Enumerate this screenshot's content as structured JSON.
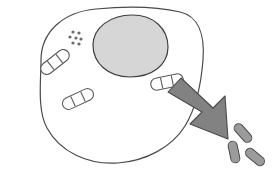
{
  "figure": {
    "background_color": "#ffffff",
    "width": 274,
    "height": 177
  },
  "colors": {
    "outline": "#4a4a4a",
    "cell_fill": "#ffffff",
    "nucleus_fill": "#d6d6d6",
    "nucleus_outline": "#3f3f3f",
    "organelle_fill": "#ffffff",
    "organelle_outline": "#5a5a5a",
    "granule_fill": "#6b6b6b",
    "arrow_fill": "#828282",
    "arrow_outline": "#4a4a4a",
    "bacteria_fill": "#9b9b9b",
    "bacteria_outline": "#4a4a4a"
  },
  "cell": {
    "label": "cell-body",
    "outline_width": 1.2,
    "path": "M 41 60 C 41 33, 62 12, 96 9 C 128 6, 158 7, 180 12 C 198 16, 205 34, 203 60 C 201 86, 196 108, 185 126 C 172 147, 146 161, 118 163 C 88 165, 60 152, 47 128 C 37 110, 41 80, 41 60 Z"
  },
  "nucleus": {
    "label": "nucleus",
    "cx": 130,
    "cy": 45,
    "rx": 37,
    "ry": 31,
    "path": "M 93 45 C 93 28, 110 15, 132 15 C 154 15, 168 29, 168 47 C 168 65, 152 77, 130 77 C 108 77, 93 63, 93 45 Z"
  },
  "granule_cluster": {
    "label": "granule-cluster",
    "count": 7,
    "radius": 1.6,
    "dots": [
      {
        "cx": 73,
        "cy": 32
      },
      {
        "cx": 79,
        "cy": 33
      },
      {
        "cx": 70,
        "cy": 37
      },
      {
        "cx": 76,
        "cy": 38
      },
      {
        "cx": 81,
        "cy": 39
      },
      {
        "cx": 73,
        "cy": 43
      },
      {
        "cx": 79,
        "cy": 44
      }
    ]
  },
  "organelles": [
    {
      "name": "internal-bacterium-upper-left",
      "cx": 55,
      "cy": 62,
      "length": 33,
      "thickness": 12,
      "rotation": -38,
      "segments": 3
    },
    {
      "name": "internal-bacterium-lower-left",
      "cx": 78,
      "cy": 99,
      "length": 33,
      "thickness": 12,
      "rotation": -25,
      "segments": 3
    },
    {
      "name": "internal-bacterium-right",
      "cx": 167,
      "cy": 82,
      "length": 33,
      "thickness": 12,
      "rotation": -12,
      "segments": 3
    }
  ],
  "arrow": {
    "label": "escape-arrow",
    "direction": "down-right",
    "start": {
      "x": 167,
      "y": 95
    },
    "end": {
      "x": 224,
      "y": 139
    },
    "shaft_width": 17,
    "head_width": 34,
    "head_length": 26,
    "path": "M 168 92 L 181 78 L 213 108 L 225 96 L 228 139 L 190 124 L 202 112 Z"
  },
  "external_bacteria": [
    {
      "name": "external-bacterium-top",
      "cx": 243,
      "cy": 133,
      "length": 22,
      "thickness": 9,
      "rotation": 48
    },
    {
      "name": "external-bacterium-left",
      "cx": 234,
      "cy": 152,
      "length": 22,
      "thickness": 9,
      "rotation": 78
    },
    {
      "name": "external-bacterium-right",
      "cx": 255,
      "cy": 157,
      "length": 22,
      "thickness": 9,
      "rotation": 40
    }
  ]
}
